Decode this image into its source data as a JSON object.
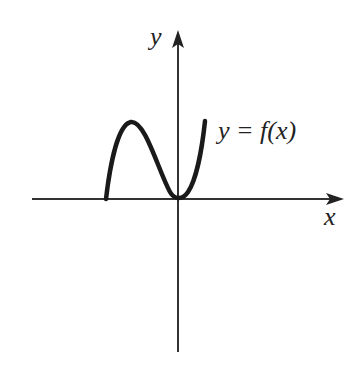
{
  "diagram": {
    "type": "function-graph",
    "axes": {
      "x_label": "x",
      "y_label": "y",
      "color": "#333333"
    },
    "curve": {
      "label": "y = f(x)",
      "color": "#1a1a1a",
      "description": "Curve starts on the negative x-axis, rises to a local maximum, falls to touch the origin (local minimum at 0), then rises steeply to the right."
    }
  }
}
